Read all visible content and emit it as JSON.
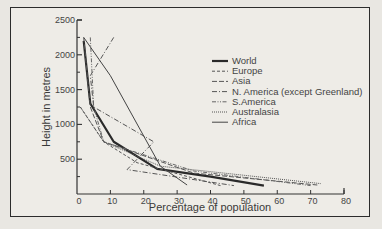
{
  "chart_data": {
    "type": "line",
    "title": "",
    "xlabel": "Percentage of population",
    "ylabel": "Height in metres",
    "xlim": [
      0,
      80
    ],
    "ylim": [
      0,
      2500
    ],
    "x_ticks": [
      "0",
      "10",
      "20",
      "30",
      "40",
      "50",
      "60",
      "70",
      "80"
    ],
    "y_ticks": [
      "500",
      "1000",
      "1500",
      "2000",
      "2500"
    ],
    "grid": false,
    "legend_position": "upper right",
    "series": [
      {
        "name": "World",
        "style": "solid-thick",
        "points": [
          [
            2,
            2200
          ],
          [
            4,
            1300
          ],
          [
            11,
            750
          ],
          [
            24,
            360
          ],
          [
            40,
            250
          ],
          [
            56,
            120
          ]
        ]
      },
      {
        "name": "Europe",
        "style": "dashed",
        "points": [
          [
            1,
            1250
          ],
          [
            8,
            750
          ],
          [
            18,
            450
          ],
          [
            43,
            120
          ]
        ]
      },
      {
        "name": "Asia",
        "style": "long-dash",
        "points": [
          [
            2,
            2250
          ],
          [
            4,
            1250
          ],
          [
            8,
            750
          ],
          [
            35,
            300
          ],
          [
            72,
            130
          ]
        ]
      },
      {
        "name": "N. America (except Greenland)",
        "style": "dash-dot",
        "points": [
          [
            11,
            2250
          ],
          [
            4,
            1700
          ],
          [
            5,
            1250
          ],
          [
            23,
            750
          ],
          [
            15,
            350
          ],
          [
            47,
            120
          ]
        ]
      },
      {
        "name": "S.America",
        "style": "dash-dot-dot",
        "points": [
          [
            4,
            2250
          ],
          [
            5,
            1250
          ],
          [
            8,
            750
          ],
          [
            35,
            330
          ],
          [
            70,
            120
          ]
        ]
      },
      {
        "name": "Australasia",
        "style": "dotted",
        "points": [
          [
            1,
            1250
          ],
          [
            8,
            750
          ],
          [
            25,
            400
          ],
          [
            73,
            150
          ]
        ]
      },
      {
        "name": "Africa",
        "style": "solid-thin",
        "points": [
          [
            2,
            2250
          ],
          [
            10,
            1700
          ],
          [
            25,
            400
          ],
          [
            33,
            130
          ]
        ]
      }
    ]
  },
  "legend": {
    "items": [
      "World",
      "Europe",
      "Asia",
      "N. America (except Greenland)",
      "S.America",
      "Australasia",
      "Africa"
    ]
  }
}
